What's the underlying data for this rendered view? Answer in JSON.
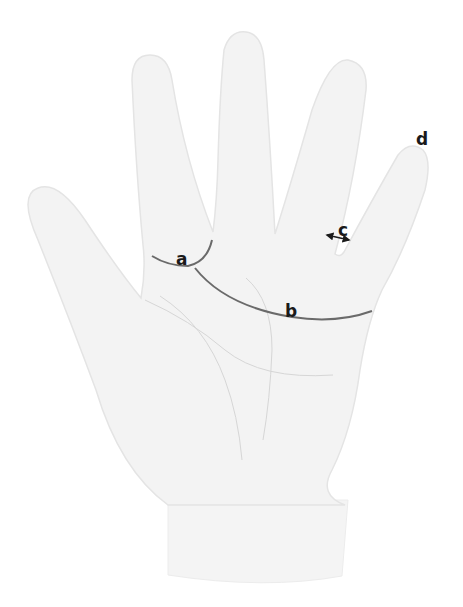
{
  "diagram": {
    "colors": {
      "background": "#ffffff",
      "hand_fill": "#f3f3f3",
      "hand_edge": "#e4e4e4",
      "palm_crease": "#d6d6d6",
      "marked_line": "#6a6a6a",
      "label_text": "#1a1a1a"
    },
    "labels": [
      {
        "id": "a",
        "text": "a",
        "x": 183,
        "y": 259,
        "describes": "arc around the base of the index finger"
      },
      {
        "id": "b",
        "text": "b",
        "x": 291,
        "y": 311,
        "describes": "long curved line across the upper palm"
      },
      {
        "id": "c",
        "text": "c",
        "x": 345,
        "y": 230,
        "describes": "double-headed arrow between ring and little finger"
      },
      {
        "id": "d",
        "text": "d",
        "x": 422,
        "y": 140,
        "describes": "tip of the little finger"
      }
    ],
    "marked_lines": [
      {
        "id": "a",
        "path": "M 152 256 Q 168 266 188 266 Q 207 262 212 240"
      },
      {
        "id": "b",
        "path": "M 195 268 Q 225 306 292 317 Q 336 324 372 311"
      }
    ],
    "arrow_c": {
      "x1": 327,
      "y1": 235,
      "x2": 349,
      "y2": 240
    }
  }
}
